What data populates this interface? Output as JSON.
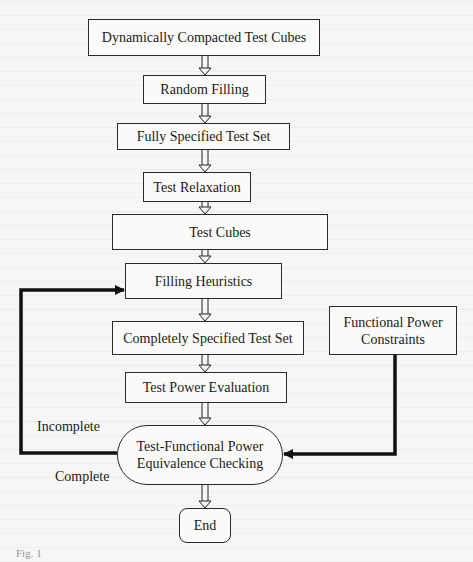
{
  "diagram": {
    "type": "flowchart",
    "nodes": [
      {
        "id": "n1",
        "label": "Dynamically Compacted Test Cubes",
        "shape": "rectangle"
      },
      {
        "id": "n2",
        "label": "Random Filling",
        "shape": "rectangle"
      },
      {
        "id": "n3",
        "label": "Fully Specified Test Set",
        "shape": "rectangle"
      },
      {
        "id": "n4",
        "label": "Test Relaxation",
        "shape": "rectangle"
      },
      {
        "id": "n5",
        "label": "Test Cubes",
        "shape": "rectangle"
      },
      {
        "id": "n6",
        "label": "Filling Heuristics",
        "shape": "rectangle"
      },
      {
        "id": "n7",
        "label": "Completely Specified Test Set",
        "shape": "rectangle"
      },
      {
        "id": "n8",
        "label": "Test Power Evaluation",
        "shape": "rectangle"
      },
      {
        "id": "n9",
        "label_line1": "Test-Functional Power",
        "label_line2": "Equivalence Checking",
        "shape": "rounded-oval"
      },
      {
        "id": "n10",
        "label": "End",
        "shape": "rounded-rectangle"
      },
      {
        "id": "n11",
        "label_line1": "Functional Power",
        "label_line2": "Constraints",
        "shape": "rectangle"
      }
    ],
    "edges": [
      {
        "from": "n1",
        "to": "n2",
        "style": "hollow-arrow"
      },
      {
        "from": "n2",
        "to": "n3",
        "style": "hollow-arrow"
      },
      {
        "from": "n3",
        "to": "n4",
        "style": "hollow-arrow"
      },
      {
        "from": "n4",
        "to": "n5",
        "style": "hollow-arrow"
      },
      {
        "from": "n5",
        "to": "n6",
        "style": "hollow-arrow"
      },
      {
        "from": "n6",
        "to": "n7",
        "style": "hollow-arrow"
      },
      {
        "from": "n7",
        "to": "n8",
        "style": "hollow-arrow"
      },
      {
        "from": "n8",
        "to": "n9",
        "style": "hollow-arrow"
      },
      {
        "from": "n9",
        "to": "n10",
        "style": "hollow-arrow",
        "label": "Complete"
      },
      {
        "from": "n9",
        "to": "n6",
        "style": "bold-line-arrow",
        "label": "Incomplete"
      },
      {
        "from": "n11",
        "to": "n9",
        "style": "bold-line-arrow"
      }
    ],
    "edge_labels": {
      "incomplete": "Incomplete",
      "complete": "Complete"
    }
  },
  "caption": "Fig. 1"
}
